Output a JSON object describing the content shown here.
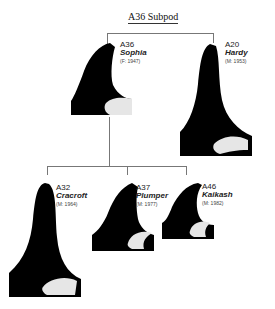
{
  "title": "A36 Subpod",
  "colors": {
    "fin": "#000000",
    "saddle": "#e8e8e8",
    "line": "#777777"
  },
  "members": [
    {
      "id": "A36",
      "name": "Sophia",
      "meta": "(F: 1947)"
    },
    {
      "id": "A20",
      "name": "Hardy",
      "meta": "(M: 1953)"
    },
    {
      "id": "A32",
      "name": "Cracroft",
      "meta": "(M: 1964)"
    },
    {
      "id": "A37",
      "name": "Plumper",
      "meta": "(M: 1977)"
    },
    {
      "id": "A46",
      "name": "Kaikash",
      "meta": "(M: 1982)"
    }
  ]
}
